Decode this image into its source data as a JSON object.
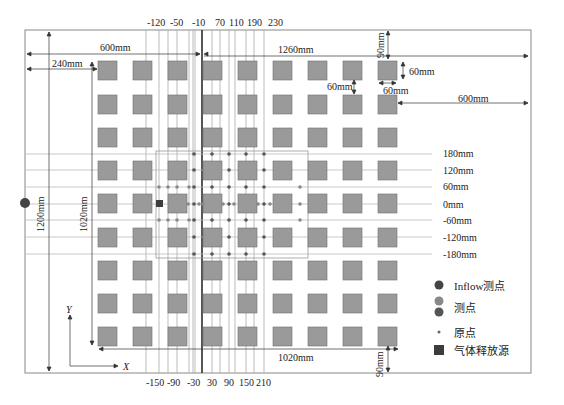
{
  "diagram": {
    "top_ticks": [
      "-120",
      "-50",
      "-10",
      "70",
      "110",
      "190",
      "230"
    ],
    "bottom_ticks": [
      "-150",
      "-90",
      "-30",
      "30",
      "90",
      "150",
      "210"
    ],
    "row_labels": [
      "180mm",
      "120mm",
      "60mm",
      "0mm",
      "-60mm",
      "-120mm",
      "-180mm"
    ],
    "dimensions": {
      "d600_left": "600mm",
      "d240": "240mm",
      "d1260": "1260mm",
      "d90_top": "90mm",
      "d60_h": "60mm",
      "d60_w": "60mm",
      "d60_gap": "60mm",
      "d600_right": "600mm",
      "d1200": "1200mm",
      "d1020_v": "1020mm",
      "d1020_h": "1020mm",
      "d90_bottom": "90mm"
    },
    "axes": {
      "x": "X",
      "y": "Y"
    },
    "grid": {
      "columns": 9,
      "rows": 9
    }
  },
  "legend": {
    "items": [
      {
        "label": "Inflow测点",
        "symbol": "dark-circle"
      },
      {
        "label": "测点",
        "symbol": "grey-dark-circles"
      },
      {
        "label": "原点",
        "symbol": "small-dot"
      },
      {
        "label": "气体释放源",
        "symbol": "dark-square"
      }
    ]
  },
  "colors": {
    "square_fill": "#9a9a9a",
    "square_stroke": "#6e6e6e",
    "point_dark": "#4a4a4a",
    "point_grey": "#808080",
    "line": "#777777",
    "source": "#3c3c3c"
  }
}
